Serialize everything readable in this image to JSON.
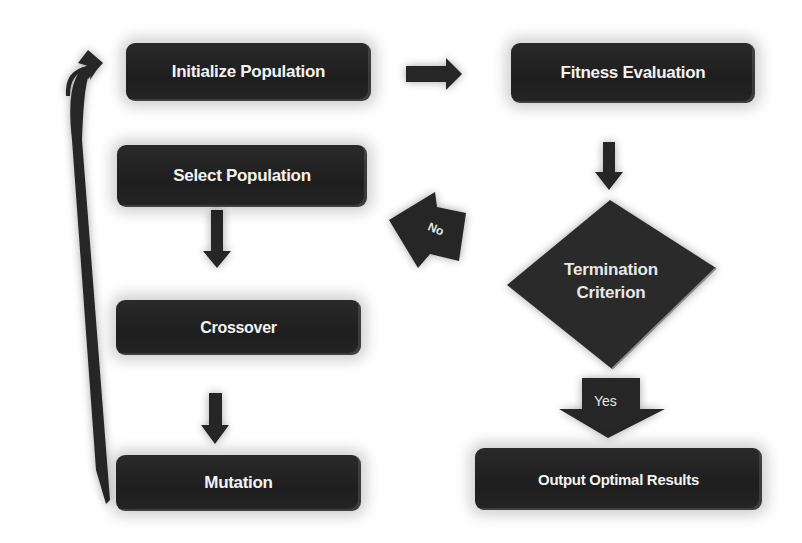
{
  "diagram": {
    "type": "flowchart",
    "nodes": {
      "initialize": "Initialize Population",
      "fitness": "Fitness Evaluation",
      "select": "Select Population",
      "crossover": "Crossover",
      "mutation": "Mutation",
      "termination_line1": "Termination",
      "termination_line2": "Criterion",
      "output": "Output Optimal Results"
    },
    "edge_labels": {
      "no": "No",
      "yes": "Yes"
    },
    "edges": [
      {
        "from": "Initialize Population",
        "to": "Fitness Evaluation"
      },
      {
        "from": "Fitness Evaluation",
        "to": "Termination Criterion"
      },
      {
        "from": "Termination Criterion",
        "to": "Select Population",
        "label": "No"
      },
      {
        "from": "Termination Criterion",
        "to": "Output Optimal Results",
        "label": "Yes"
      },
      {
        "from": "Select Population",
        "to": "Crossover"
      },
      {
        "from": "Crossover",
        "to": "Mutation"
      },
      {
        "from": "Mutation",
        "to": "Initialize Population"
      }
    ],
    "colors": {
      "node_fill": "#222222",
      "node_text": "#f2f2f2",
      "diamond_fill": "#2e2e2e",
      "arrow": "#262626",
      "background": "#ffffff"
    }
  }
}
